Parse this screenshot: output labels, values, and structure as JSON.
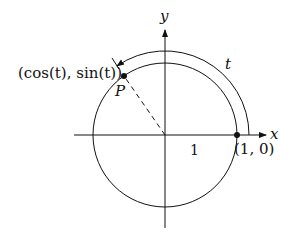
{
  "diagram": {
    "axes": {
      "x_label": "x",
      "y_label": "y"
    },
    "labels": {
      "point_p": "P",
      "point_coords": "(cos(t), sin(t))",
      "arc": "t",
      "radius": "1",
      "start_point": "(1, 0)"
    },
    "geometry": {
      "center": [
        165,
        135
      ],
      "radius": 72,
      "arc_offset_radius": 84,
      "angle_deg": 125
    },
    "colors": {
      "stroke": "#111111",
      "background": "#ffffff"
    }
  }
}
